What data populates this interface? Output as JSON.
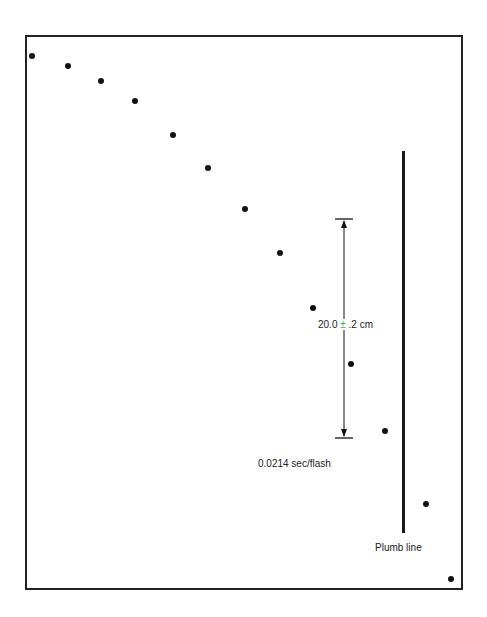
{
  "diagram": {
    "frame": {
      "left": 25,
      "top": 35,
      "right": 461,
      "bottom": 588
    },
    "dots": [
      {
        "x": 32,
        "y": 56
      },
      {
        "x": 68,
        "y": 66
      },
      {
        "x": 101,
        "y": 81
      },
      {
        "x": 135,
        "y": 101
      },
      {
        "x": 173,
        "y": 135
      },
      {
        "x": 208,
        "y": 168
      },
      {
        "x": 245,
        "y": 209
      },
      {
        "x": 280,
        "y": 253
      },
      {
        "x": 313,
        "y": 308
      },
      {
        "x": 351,
        "y": 364
      },
      {
        "x": 385,
        "y": 431
      },
      {
        "x": 426,
        "y": 504
      },
      {
        "x": 451,
        "y": 579
      }
    ],
    "measurement": {
      "x": 344,
      "top": 219,
      "bottom": 438,
      "tick_half_width": 9,
      "value": "20.0",
      "plus_minus": "±",
      "tolerance": ".2 cm"
    },
    "flash_rate_label": "0.0214 sec/flash",
    "plumb_line": {
      "x": 403,
      "top": 151,
      "bottom": 533,
      "label": "Plumb line"
    },
    "colors": {
      "ink": "#111111",
      "plus_minus": "#5a9a6a",
      "background": "#ffffff"
    }
  }
}
